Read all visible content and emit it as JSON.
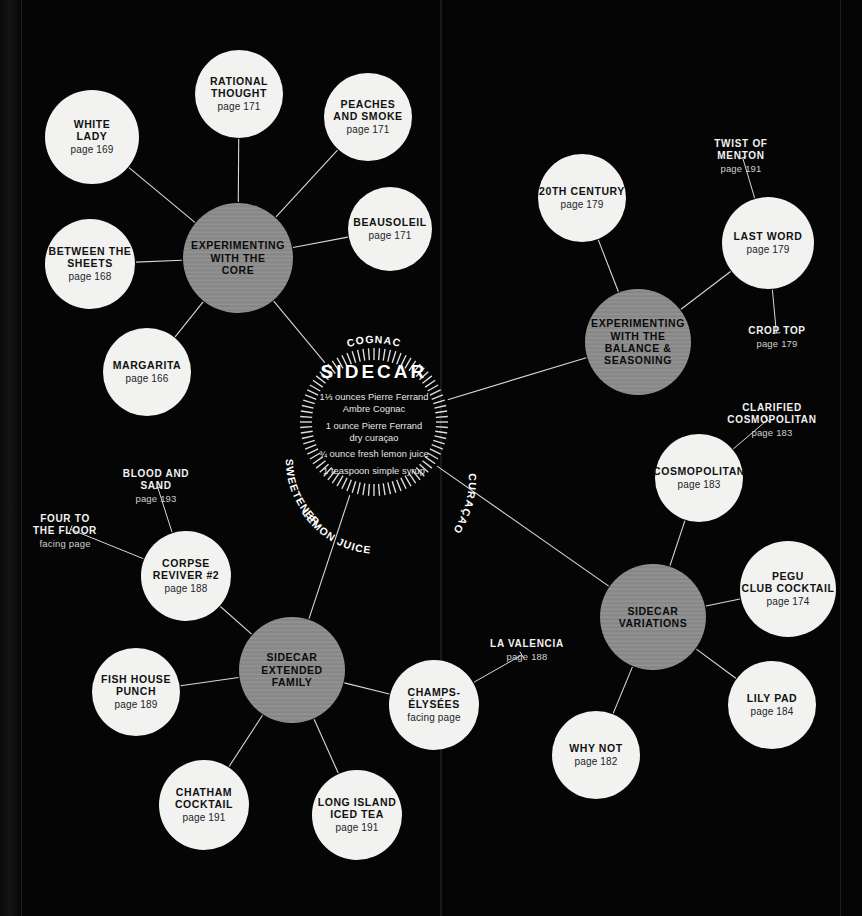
{
  "center": {
    "title": "SIDECAR",
    "recipe": [
      "1⅓ ounces Pierre Ferrand\nAmbre Cognac",
      "1 ounce Pierre Ferrand\ndry curaçao",
      "¾ ounce fresh lemon juice",
      "1 teaspoon simple syrup"
    ],
    "ring_labels": [
      "COGNAC",
      "SWEETENER",
      "LEMON JUICE",
      "CURAÇAO"
    ]
  },
  "colors": {
    "background": "#050505",
    "leaf_fill": "#f2f2f0",
    "hub_fill": "#8d8d8d",
    "text_dark": "#111111",
    "text_light": "#f2f2f0",
    "link": "#d8d8d8"
  },
  "hubs": [
    {
      "id": "core",
      "name": "EXPERIMENTING\nWITH THE\nCORE",
      "cx": 238,
      "cy": 258,
      "r": 55
    },
    {
      "id": "balance",
      "name": "EXPERIMENTING\nWITH THE\nBALANCE &\nSEASONING",
      "cx": 638,
      "cy": 342,
      "r": 53
    },
    {
      "id": "family",
      "name": "SIDECAR\nEXTENDED\nFAMILY",
      "cx": 292,
      "cy": 670,
      "r": 53
    },
    {
      "id": "variations",
      "name": "SIDECAR\nVARIATIONS",
      "cx": 653,
      "cy": 617,
      "r": 53
    }
  ],
  "nodes": [
    {
      "id": "white-lady",
      "name": "WHITE\nLADY",
      "page": "page 169",
      "cx": 92,
      "cy": 137,
      "r": 47
    },
    {
      "id": "rational-thought",
      "name": "RATIONAL\nTHOUGHT",
      "page": "page 171",
      "cx": 239,
      "cy": 94,
      "r": 44
    },
    {
      "id": "peaches-and-smoke",
      "name": "PEACHES\nAND SMOKE",
      "page": "page 171",
      "cx": 368,
      "cy": 117,
      "r": 44
    },
    {
      "id": "beausoleil",
      "name": "BEAUSOLEIL",
      "page": "page 171",
      "cx": 390,
      "cy": 229,
      "r": 42
    },
    {
      "id": "between-the-sheets",
      "name": "BETWEEN THE\nSHEETS",
      "page": "page 168",
      "cx": 90,
      "cy": 264,
      "r": 45
    },
    {
      "id": "margarita",
      "name": "MARGARITA",
      "page": "page 166",
      "cx": 147,
      "cy": 372,
      "r": 44
    },
    {
      "id": "20th-century",
      "name": "20TH CENTURY",
      "page": "page 179",
      "cx": 582,
      "cy": 198,
      "r": 44
    },
    {
      "id": "last-word",
      "name": "LAST WORD",
      "page": "page 179",
      "cx": 768,
      "cy": 243,
      "r": 46
    },
    {
      "id": "cosmopolitan",
      "name": "COSMOPOLITAN",
      "page": "page 183",
      "cx": 699,
      "cy": 478,
      "r": 44
    },
    {
      "id": "pegu-club",
      "name": "PEGU\nCLUB COCKTAIL",
      "page": "page 174",
      "cx": 788,
      "cy": 589,
      "r": 48
    },
    {
      "id": "lily-pad",
      "name": "LILY PAD",
      "page": "page 184",
      "cx": 772,
      "cy": 705,
      "r": 44
    },
    {
      "id": "why-not",
      "name": "WHY NOT",
      "page": "page 182",
      "cx": 596,
      "cy": 755,
      "r": 44
    },
    {
      "id": "corpse-reviver-2",
      "name": "CORPSE\nREVIVER #2",
      "page": "page 188",
      "cx": 186,
      "cy": 576,
      "r": 45
    },
    {
      "id": "fish-house-punch",
      "name": "FISH HOUSE\nPUNCH",
      "page": "page 189",
      "cx": 136,
      "cy": 692,
      "r": 44
    },
    {
      "id": "chatham-cocktail",
      "name": "CHATHAM\nCOCKTAIL",
      "page": "page 191",
      "cx": 204,
      "cy": 805,
      "r": 45
    },
    {
      "id": "long-island",
      "name": "LONG ISLAND\nICED TEA",
      "page": "page 191",
      "cx": 357,
      "cy": 815,
      "r": 45
    },
    {
      "id": "champs-elysees",
      "name": "CHAMPS-\nÉLYSÉES",
      "page": "facing page",
      "cx": 434,
      "cy": 705,
      "r": 45
    }
  ],
  "text_labels": [
    {
      "id": "twist-of-menton",
      "name": "TWIST OF\nMENTON",
      "page": "page 191",
      "x": 741,
      "y": 138
    },
    {
      "id": "crop-top",
      "name": "CROP TOP",
      "page": "page 179",
      "x": 777,
      "y": 325
    },
    {
      "id": "clarified-cosmopolitan",
      "name": "CLARIFIED\nCOSMOPOLITAN",
      "page": "page 183",
      "x": 772,
      "y": 402
    },
    {
      "id": "blood-and-sand",
      "name": "BLOOD AND\nSAND",
      "page": "page 193",
      "x": 156,
      "y": 468
    },
    {
      "id": "four-to-the-floor",
      "name": "FOUR TO\nTHE FLOOR",
      "facing": "facing page",
      "x": 65,
      "y": 513
    },
    {
      "id": "la-valencia",
      "name": "LA VALENCIA",
      "page": "page 188",
      "x": 527,
      "y": 638
    }
  ],
  "links": [
    {
      "from": "core",
      "to": "white-lady"
    },
    {
      "from": "core",
      "to": "rational-thought"
    },
    {
      "from": "core",
      "to": "peaches-and-smoke"
    },
    {
      "from": "core",
      "to": "beausoleil"
    },
    {
      "from": "core",
      "to": "between-the-sheets"
    },
    {
      "from": "core",
      "to": "margarita"
    },
    {
      "from": "core",
      "to": "center"
    },
    {
      "from": "balance",
      "to": "20th-century"
    },
    {
      "from": "balance",
      "to": "last-word"
    },
    {
      "from": "balance",
      "to": "center"
    },
    {
      "from": "last-word",
      "to": "twist-of-menton"
    },
    {
      "from": "last-word",
      "to": "crop-top"
    },
    {
      "from": "variations",
      "to": "cosmopolitan"
    },
    {
      "from": "variations",
      "to": "pegu-club"
    },
    {
      "from": "variations",
      "to": "lily-pad"
    },
    {
      "from": "variations",
      "to": "why-not"
    },
    {
      "from": "variations",
      "to": "center"
    },
    {
      "from": "cosmopolitan",
      "to": "clarified-cosmopolitan"
    },
    {
      "from": "family",
      "to": "corpse-reviver-2"
    },
    {
      "from": "family",
      "to": "fish-house-punch"
    },
    {
      "from": "family",
      "to": "chatham-cocktail"
    },
    {
      "from": "family",
      "to": "long-island"
    },
    {
      "from": "family",
      "to": "champs-elysees"
    },
    {
      "from": "family",
      "to": "center"
    },
    {
      "from": "corpse-reviver-2",
      "to": "blood-and-sand"
    },
    {
      "from": "corpse-reviver-2",
      "to": "four-to-the-floor"
    },
    {
      "from": "champs-elysees",
      "to": "la-valencia"
    }
  ]
}
